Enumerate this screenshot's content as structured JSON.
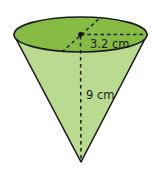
{
  "figure": {
    "shape": "cone",
    "radius_label": "3.2 cm",
    "height_label": "9 cm",
    "colors": {
      "top_face": "#86bb44",
      "body": "#b9db90",
      "outline": "#1c1c1c"
    }
  }
}
